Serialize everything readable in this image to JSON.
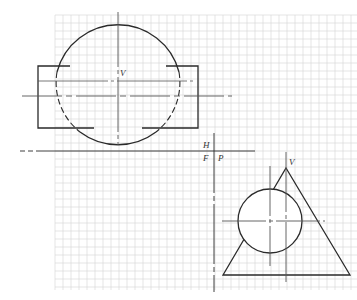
{
  "figure": {
    "type": "orthographic-projection-exercise",
    "colors": {
      "background": "#ffffff",
      "grid": "#d4d4d4",
      "line": "#2a2a2a",
      "thin": "#555555"
    },
    "labels": {
      "top_view_vertex": "V",
      "fold_h": "H",
      "fold_f": "F",
      "fold_p": "P",
      "profile_vertex": "V"
    },
    "grid": {
      "x0": 55,
      "y0": 15,
      "x1": 357,
      "y1": 290,
      "cell": 8
    },
    "top_view": {
      "circle": {
        "cx": 118,
        "cy": 82,
        "r": 63
      },
      "rectangle": {
        "x": 38,
        "y": 66,
        "w": 160,
        "h": 62
      },
      "centerline_v": {
        "x": 118,
        "y1": 12,
        "y2": 145
      },
      "centerline_h": {
        "y": 96,
        "x1": 22,
        "x2": 232
      },
      "axis_line": {
        "y": 81,
        "x1": 38,
        "x2": 196
      }
    },
    "fold_lines": {
      "hf": {
        "y": 151,
        "x1": 20,
        "x2": 255
      },
      "fp": {
        "x": 214,
        "y1": 133,
        "y2": 292
      }
    },
    "profile_view": {
      "triangle": {
        "apex": [
          286,
          168
        ],
        "base_left": [
          223,
          275
        ],
        "base_right": [
          350,
          275
        ]
      },
      "circle": {
        "cx": 270,
        "cy": 221,
        "r": 32
      },
      "centerline_v1": {
        "x": 270,
        "y1": 166,
        "y2": 266
      },
      "centerline_v2": {
        "x": 286,
        "y1": 152,
        "y2": 283
      },
      "centerline_h": {
        "y": 221,
        "x1": 222,
        "x2": 325
      }
    }
  }
}
